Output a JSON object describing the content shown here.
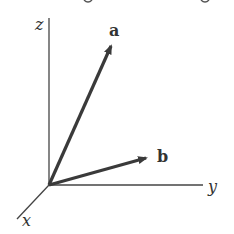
{
  "diagram": {
    "type": "3d-vector-axes",
    "axes": [
      {
        "name": "z",
        "label": "z"
      },
      {
        "name": "y",
        "label": "y"
      },
      {
        "name": "x",
        "label": "x"
      }
    ],
    "vectors": [
      {
        "name": "a",
        "label": "a"
      },
      {
        "name": "b",
        "label": "b"
      }
    ],
    "colors": {
      "axis": "#444444",
      "vector": "#3a3a3a",
      "label": "#333333",
      "background": "#ffffff"
    }
  }
}
